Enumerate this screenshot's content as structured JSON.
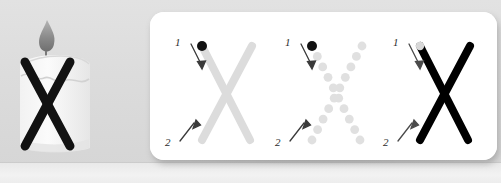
{
  "worksheet": {
    "letter": "X",
    "illustration": {
      "name": "candle",
      "overlay_letter": "X",
      "flame_color": "#8d8d8d",
      "body_color": "#f7f7f7",
      "stroke_color": "#111111"
    },
    "background_color": "#dcdcdc",
    "panel_color": "#ffffff"
  },
  "practice": {
    "stroke_labels": {
      "first": "1",
      "second": "2"
    },
    "cells": [
      {
        "id": "trace-solid-gray",
        "style": "solid",
        "letter": "X",
        "stroke_color": "#dcdcdc",
        "start_dot_color": "#111111",
        "label_one": "1",
        "label_two": "2"
      },
      {
        "id": "trace-dotted",
        "style": "dotted",
        "letter": "X",
        "stroke_color": "#e0e0e0",
        "start_dot_color": "#111111",
        "label_one": "1",
        "label_two": "2"
      },
      {
        "id": "model-solid-black",
        "style": "solid",
        "letter": "X",
        "stroke_color": "#000000",
        "start_dot_color": "#d8d8d8",
        "label_one": "1",
        "label_two": "2"
      }
    ]
  }
}
